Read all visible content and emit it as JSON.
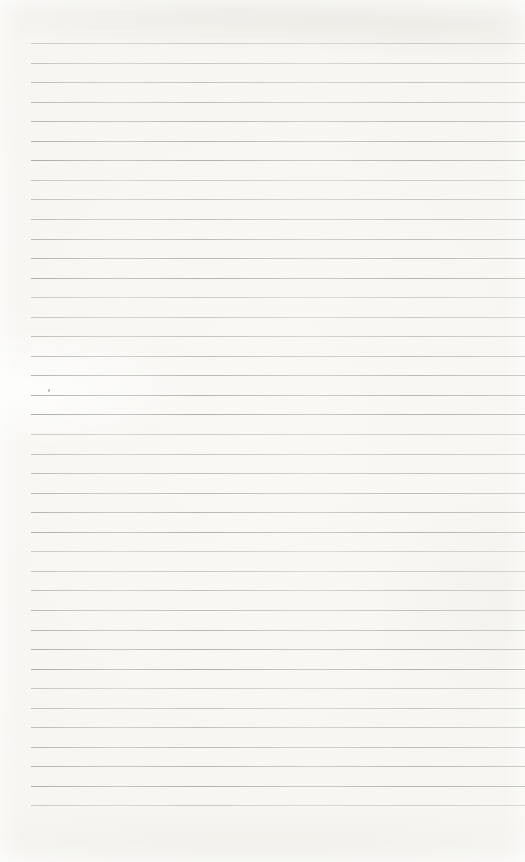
{
  "document": {
    "kind": "blank-lined-notebook-page",
    "visible_text": "",
    "paper_color": "#f6f5f1",
    "line_color": "#9c9d99",
    "ruling": {
      "line_count": 40,
      "first_line_top": 43,
      "spacing": 19.55,
      "left_inset": 31,
      "right_inset": 0
    }
  }
}
